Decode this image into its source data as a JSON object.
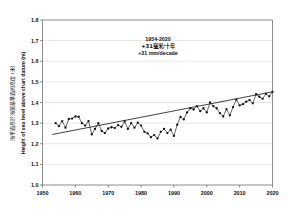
{
  "chart_data": {
    "type": "line",
    "title": "",
    "xlabel": "",
    "ylabel": "Height of sea level above chart datum (m)",
    "ylabel_cjk": "海平面高於海圖基準面的高度 (米)",
    "xlim": [
      1950,
      2020
    ],
    "ylim": [
      1.0,
      1.8
    ],
    "ytick_step": 0.1,
    "grid": true,
    "legend": "none",
    "xticks": [
      "1950",
      "1960",
      "1970",
      "1980",
      "1990",
      "2000",
      "2010",
      "2020"
    ],
    "xtick_values": [
      1950,
      1960,
      1970,
      1980,
      1990,
      2000,
      2010,
      2020
    ],
    "yticks": [
      "1.0",
      "1.1",
      "1.2",
      "1.3",
      "1.4",
      "1.5",
      "1.6",
      "1.7",
      "1.8"
    ],
    "ytick_values": [
      1.0,
      1.1,
      1.2,
      1.3,
      1.4,
      1.5,
      1.6,
      1.7,
      1.8
    ],
    "x": [
      1954,
      1955,
      1956,
      1957,
      1958,
      1959,
      1960,
      1961,
      1962,
      1963,
      1964,
      1965,
      1966,
      1967,
      1968,
      1969,
      1970,
      1971,
      1972,
      1973,
      1974,
      1975,
      1976,
      1977,
      1978,
      1979,
      1980,
      1981,
      1982,
      1983,
      1984,
      1985,
      1986,
      1987,
      1988,
      1989,
      1990,
      1991,
      1992,
      1993,
      1994,
      1995,
      1996,
      1997,
      1998,
      1999,
      2000,
      2001,
      2002,
      2003,
      2004,
      2005,
      2006,
      2007,
      2008,
      2009,
      2010,
      2011,
      2012,
      2013,
      2014,
      2015,
      2016,
      2017,
      2018,
      2019,
      2020
    ],
    "values": [
      1.3,
      1.285,
      1.31,
      1.278,
      1.32,
      1.322,
      1.332,
      1.331,
      1.3,
      1.288,
      1.31,
      1.245,
      1.272,
      1.3,
      1.262,
      1.252,
      1.274,
      1.28,
      1.276,
      1.29,
      1.282,
      1.308,
      1.272,
      1.3,
      1.278,
      1.302,
      1.288,
      1.258,
      1.25,
      1.232,
      1.242,
      1.226,
      1.258,
      1.272,
      1.252,
      1.268,
      1.238,
      1.292,
      1.33,
      1.318,
      1.352,
      1.372,
      1.366,
      1.382,
      1.358,
      1.372,
      1.352,
      1.4,
      1.382,
      1.372,
      1.348,
      1.332,
      1.368,
      1.338,
      1.378,
      1.414,
      1.386,
      1.392,
      1.404,
      1.412,
      1.396,
      1.44,
      1.428,
      1.418,
      1.442,
      1.43,
      1.452
    ],
    "series_name": "Annual mean sea level",
    "trend": {
      "name": "Linear trend",
      "x_start": 1953,
      "x_end": 2020,
      "y_start": 1.245,
      "y_end": 1.452
    },
    "annotations": [
      {
        "text": "1954-2020"
      },
      {
        "text": "+31毫米/十年"
      },
      {
        "text": "+31 mm/decade"
      }
    ]
  }
}
